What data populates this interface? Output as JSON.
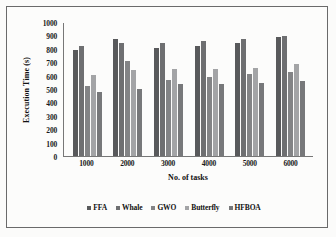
{
  "chart_data": {
    "type": "bar",
    "title": "",
    "xlabel": "No. of tasks",
    "ylabel": "Execution Time (s)",
    "categories": [
      "1000",
      "2000",
      "3000",
      "4000",
      "5000",
      "6000"
    ],
    "ylim": [
      0,
      1000
    ],
    "yticks": [
      0,
      100,
      200,
      300,
      400,
      500,
      600,
      700,
      800,
      900,
      1000
    ],
    "grid": false,
    "legend_position": "bottom",
    "series": [
      {
        "name": "FFA",
        "color": "#58595b",
        "values": [
          790,
          875,
          808,
          823,
          840,
          885
        ]
      },
      {
        "name": "Whale",
        "color": "#6e6f71",
        "values": [
          820,
          845,
          843,
          860,
          870,
          893
        ]
      },
      {
        "name": "GWO",
        "color": "#838486",
        "values": [
          520,
          710,
          565,
          592,
          615,
          625
        ]
      },
      {
        "name": "Butterfly",
        "color": "#a3a4a6",
        "values": [
          605,
          640,
          648,
          648,
          660,
          685
        ]
      },
      {
        "name": "HFBOA",
        "color": "#77787a",
        "values": [
          480,
          500,
          535,
          540,
          548,
          560
        ]
      }
    ]
  }
}
